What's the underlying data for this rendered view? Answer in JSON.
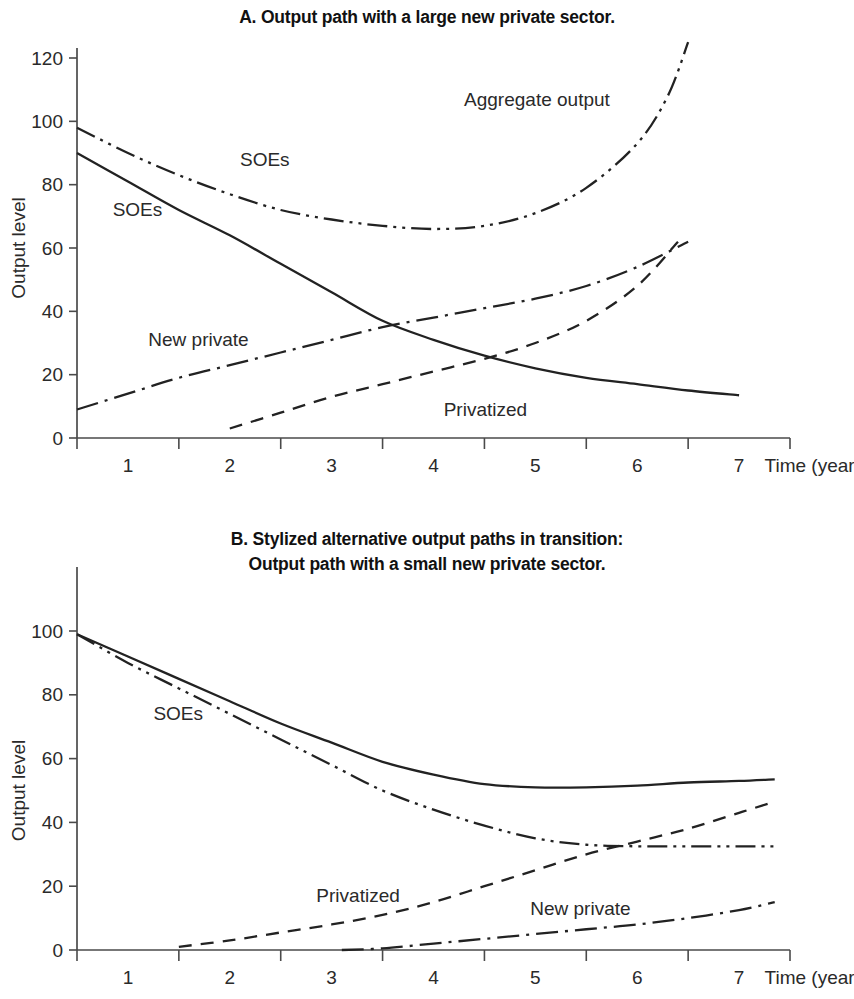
{
  "figure": {
    "panel_a_title": "A. Output path with a large new private sector.",
    "panel_b_title_line1": "B. Stylized alternative output paths in transition:",
    "panel_b_title_line2": "Output path with a small new private sector."
  },
  "chart_data": [
    {
      "type": "line",
      "id": "panel-a",
      "title": "A. Output path with a large new private sector.",
      "xlabel": "Time (years)",
      "ylabel": "Output level",
      "xlim": [
        0.5,
        7.5
      ],
      "ylim": [
        0,
        128
      ],
      "xticks": [
        1,
        2,
        3,
        4,
        5,
        6,
        7
      ],
      "xticklabels": [
        "1",
        "2",
        "3",
        "4",
        "5",
        "6",
        "7"
      ],
      "yticks": [
        0,
        20,
        40,
        60,
        80,
        100,
        120
      ],
      "yticklabels": [
        "0",
        "20",
        "40",
        "60",
        "80",
        "100",
        "120"
      ],
      "grid": false,
      "legend": "inline-annotations",
      "series": [
        {
          "name": "Aggregate output",
          "label": "SOEs",
          "annotation": "Aggregate output",
          "style": "dash-dot-dot",
          "x": [
            0.5,
            1.0,
            1.5,
            2.0,
            2.5,
            3.0,
            3.5,
            4.0,
            4.5,
            5.0,
            5.5,
            6.0,
            6.3,
            6.5
          ],
          "y": [
            98,
            90,
            83,
            77,
            72,
            69,
            67,
            66,
            67,
            71,
            79,
            93,
            108,
            125
          ]
        },
        {
          "name": "SOEs",
          "label": "SOEs",
          "style": "solid",
          "x": [
            0.5,
            1.0,
            1.5,
            2.0,
            2.5,
            3.0,
            3.5,
            4.0,
            4.5,
            5.0,
            5.5,
            6.0,
            6.5,
            7.0
          ],
          "y": [
            90,
            81,
            72,
            64,
            55,
            46,
            37,
            31,
            26,
            22,
            19,
            17,
            15,
            13.5
          ]
        },
        {
          "name": "New private",
          "label": "New private",
          "style": "dash-dot",
          "x": [
            0.5,
            1.0,
            1.5,
            2.0,
            2.5,
            3.0,
            3.5,
            4.0,
            4.5,
            5.0,
            5.5,
            6.0,
            6.5
          ],
          "y": [
            9,
            14,
            19,
            23,
            27,
            31,
            35,
            38,
            41,
            44,
            48,
            54,
            62
          ]
        },
        {
          "name": "Privatized",
          "label": "Privatized",
          "style": "dashed",
          "x": [
            2.0,
            2.5,
            3.0,
            3.5,
            4.0,
            4.5,
            5.0,
            5.5,
            6.0,
            6.4
          ],
          "y": [
            3,
            8,
            13,
            17,
            21,
            25,
            30,
            37,
            48,
            62
          ]
        }
      ],
      "annotations": [
        {
          "text": "SOEs",
          "x": 2.1,
          "y": 86
        },
        {
          "text": "SOEs",
          "x": 0.85,
          "y": 70
        },
        {
          "text": "New private",
          "x": 1.2,
          "y": 29
        },
        {
          "text": "Privatized",
          "x": 4.1,
          "y": 7
        },
        {
          "text": "Aggregate output",
          "x": 4.3,
          "y": 105
        },
        {
          "text": "Time (years)",
          "x": 7.25,
          "y": -11
        }
      ]
    },
    {
      "type": "line",
      "id": "panel-b",
      "title": "B. Stylized alternative output paths in transition: Output path with a small new private sector.",
      "xlabel": "Time (years)",
      "ylabel": "Output level",
      "xlim": [
        0.5,
        7.5
      ],
      "ylim": [
        0,
        110
      ],
      "xticks": [
        1,
        2,
        3,
        4,
        5,
        6,
        7
      ],
      "xticklabels": [
        "1",
        "2",
        "3",
        "4",
        "5",
        "6",
        "7"
      ],
      "yticks": [
        0,
        20,
        40,
        60,
        80,
        100
      ],
      "yticklabels": [
        "0",
        "20",
        "40",
        "60",
        "80",
        "100"
      ],
      "grid": false,
      "legend": "inline-annotations",
      "series": [
        {
          "name": "Aggregate output",
          "style": "solid",
          "x": [
            0.5,
            1.0,
            1.5,
            2.0,
            2.5,
            3.0,
            3.5,
            4.0,
            4.5,
            5.0,
            5.5,
            6.0,
            6.5,
            7.0,
            7.35
          ],
          "y": [
            99,
            92,
            85,
            78,
            71,
            65,
            59,
            55,
            52,
            51,
            51,
            51.5,
            52.5,
            53,
            53.5
          ]
        },
        {
          "name": "SOEs",
          "label": "SOEs",
          "style": "dash-dot-dot",
          "x": [
            0.5,
            1.0,
            1.5,
            2.0,
            2.5,
            3.0,
            3.5,
            4.0,
            4.5,
            5.0,
            5.5,
            6.0,
            6.5,
            7.0,
            7.35
          ],
          "y": [
            99,
            90,
            82,
            74,
            66,
            58,
            50,
            44,
            39,
            35,
            33,
            32.5,
            32.5,
            32.5,
            32.5
          ]
        },
        {
          "name": "Privatized",
          "label": "Privatized",
          "style": "dashed",
          "x": [
            1.5,
            2.0,
            2.5,
            3.0,
            3.5,
            4.0,
            4.5,
            5.0,
            5.5,
            6.0,
            6.5,
            7.0,
            7.35
          ],
          "y": [
            1,
            3,
            5.5,
            8,
            11,
            15,
            20,
            25,
            30,
            34,
            38,
            43,
            46.5
          ]
        },
        {
          "name": "New private",
          "label": "New private",
          "style": "dash-dot",
          "x": [
            3.1,
            3.5,
            4.0,
            4.5,
            5.0,
            5.5,
            6.0,
            6.5,
            7.0,
            7.35
          ],
          "y": [
            0,
            0.5,
            2,
            3.5,
            5,
            6.5,
            8,
            10,
            12.5,
            15
          ]
        }
      ],
      "annotations": [
        {
          "text": "SOEs",
          "x": 1.25,
          "y": 72
        },
        {
          "text": "Privatized",
          "x": 2.85,
          "y": 15
        },
        {
          "text": "New private",
          "x": 4.95,
          "y": 11
        },
        {
          "text": "Time (years)",
          "x": 7.25,
          "y": -11
        }
      ]
    }
  ]
}
